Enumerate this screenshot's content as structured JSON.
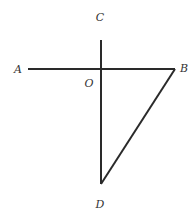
{
  "diagram": {
    "stroke_color": "#2a2a2a",
    "label_color": "#333333",
    "points": {
      "A": {
        "x": 28,
        "y": 69
      },
      "B": {
        "x": 175,
        "y": 69
      },
      "C": {
        "x": 101,
        "y": 40
      },
      "O": {
        "x": 101,
        "y": 69
      },
      "D": {
        "x": 101,
        "y": 184
      }
    },
    "segments": [
      {
        "from": "A",
        "to": "B"
      },
      {
        "from": "C",
        "to": "D"
      },
      {
        "from": "B",
        "to": "D"
      }
    ],
    "labels": {
      "A": {
        "text": "A",
        "x": 18,
        "y": 69
      },
      "B": {
        "text": "B",
        "x": 184,
        "y": 68
      },
      "C": {
        "text": "C",
        "x": 100,
        "y": 17
      },
      "O": {
        "text": "O",
        "x": 89,
        "y": 83
      },
      "D": {
        "text": "D",
        "x": 100,
        "y": 204
      }
    }
  }
}
